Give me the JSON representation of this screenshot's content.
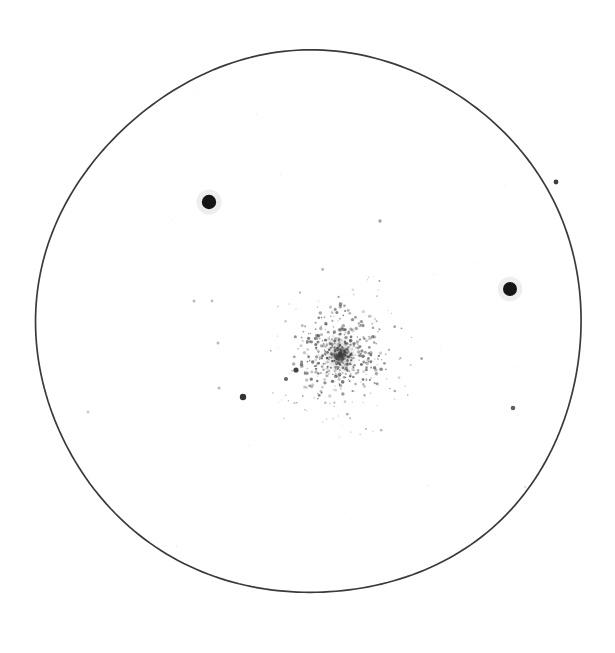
{
  "figure": {
    "kind": "astronomical-field-sketch",
    "medium": "scanned line drawing on white paper",
    "background_color": "#ffffff",
    "ink_color": "#2e2e2e",
    "width": 615,
    "height": 653,
    "caption": "",
    "title": "",
    "labels": []
  },
  "field_of_view": {
    "name": "eyepiece-field-circle",
    "shape": "circle",
    "center_x": 310,
    "center_y": 323,
    "radius": 272,
    "stroke_color": "#3a3a3a",
    "stroke_width": 1.7,
    "fill": "none",
    "hand_drawn": true
  },
  "chart_data": {
    "type": "scatter",
    "title": "",
    "xlabel": "",
    "ylabel": "",
    "xlim": [
      0,
      615
    ],
    "ylim": [
      0,
      653
    ],
    "grid": false,
    "legend": "none",
    "note": "Positions are in image pixel coordinates; magnitude is encoded as plotted dot radius in pixels.",
    "series": [
      {
        "name": "bright field stars",
        "color": "#0d0d0d",
        "points": [
          {
            "x": 209,
            "y": 202,
            "r": 7.2,
            "opacity": 0.97
          },
          {
            "x": 510,
            "y": 289,
            "r": 7.0,
            "opacity": 0.97
          }
        ]
      },
      {
        "name": "moderate field stars",
        "color": "#222222",
        "points": [
          {
            "x": 243,
            "y": 397,
            "r": 3.2,
            "opacity": 0.92
          },
          {
            "x": 556,
            "y": 182,
            "r": 2.4,
            "opacity": 0.88
          },
          {
            "x": 513,
            "y": 408,
            "r": 2.3,
            "opacity": 0.72
          },
          {
            "x": 296,
            "y": 370,
            "r": 2.6,
            "opacity": 0.85
          },
          {
            "x": 286,
            "y": 379,
            "r": 2.0,
            "opacity": 0.7
          }
        ]
      },
      {
        "name": "faint field stars",
        "color": "#555555",
        "points": [
          {
            "x": 380,
            "y": 221,
            "r": 1.7,
            "opacity": 0.55
          },
          {
            "x": 194,
            "y": 301,
            "r": 1.5,
            "opacity": 0.42
          },
          {
            "x": 212,
            "y": 301,
            "r": 1.4,
            "opacity": 0.38
          },
          {
            "x": 218,
            "y": 343,
            "r": 1.5,
            "opacity": 0.4
          },
          {
            "x": 219,
            "y": 388,
            "r": 1.6,
            "opacity": 0.4
          },
          {
            "x": 88,
            "y": 412,
            "r": 1.5,
            "opacity": 0.3
          },
          {
            "x": 525,
            "y": 487,
            "r": 1.3,
            "opacity": 0.18
          }
        ]
      }
    ],
    "cluster": {
      "name": "globular-cluster",
      "center_x": 340,
      "center_y": 355,
      "core_radius": 13,
      "halo_radius": 48,
      "star_count": 640,
      "core_color": "#6e6e6e",
      "star_color": "#3f3f3f",
      "concentration": 2.4
    }
  },
  "render": {
    "seed": 20240517,
    "speckle_count": 110,
    "speckle_color": "#bdbdbd"
  }
}
